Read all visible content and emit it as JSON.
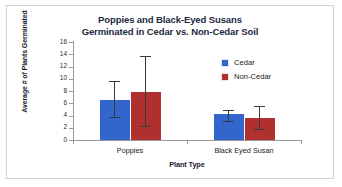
{
  "chart_data": {
    "type": "bar",
    "title": "Poppies and Black-Eyed Susans Germinated in Cedar vs. Non-Cedar Soil",
    "title_lines": [
      "Poppies and Black-Eyed Susans",
      "Germinated in Cedar vs. Non-Cedar Soil"
    ],
    "xlabel": "Plant Type",
    "ylabel": "Average # of Plants Germinated",
    "categories": [
      "Poppies",
      "Black Eyed Susan"
    ],
    "ylim": [
      0,
      16
    ],
    "ytick_step": 2,
    "yticks": [
      0,
      2,
      4,
      6,
      8,
      10,
      12,
      14,
      16
    ],
    "grid": false,
    "legend_position": "inside-top-right",
    "series": [
      {
        "name": "Cedar",
        "color": "#3366cc",
        "values": [
          6.5,
          4.2
        ],
        "error_low": [
          3.6,
          3.0
        ],
        "error_high": [
          9.7,
          4.9
        ]
      },
      {
        "name": "Non-Cedar",
        "color": "#b03030",
        "values": [
          7.9,
          3.6
        ],
        "error_low": [
          2.1,
          1.7
        ],
        "error_high": [
          13.7,
          5.5
        ]
      }
    ]
  },
  "frame": {
    "border_color": "#d2d2d2",
    "background": "#ffffff"
  }
}
